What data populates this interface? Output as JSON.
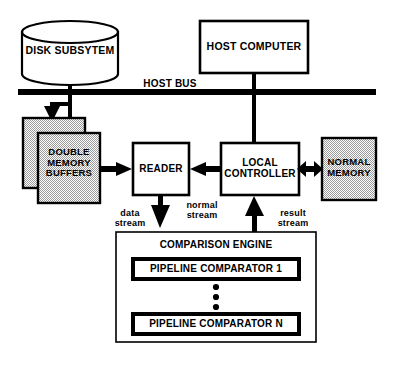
{
  "diagram": {
    "title_text": "",
    "colors": {
      "stroke": "#000000",
      "fill_white": "#ffffff",
      "fill_gray": "#d9d9d9",
      "background": "#ffffff"
    },
    "nodes": {
      "disk_subsystem": {
        "label": "DISK SUBSYTEM",
        "shape": "cylinder",
        "fill": "#ffffff"
      },
      "host_computer": {
        "label": "HOST COMPUTER",
        "shape": "rect",
        "fill": "#ffffff"
      },
      "host_bus": {
        "label": "HOST BUS",
        "shape": "bus-line"
      },
      "double_memory_buffers": {
        "label": "DOUBLE\nMEMORY\nBUFFERS",
        "shape": "stacked-rect",
        "fill": "#d9d9d9"
      },
      "reader": {
        "label": "READER",
        "shape": "rect",
        "fill": "#ffffff"
      },
      "local_controller": {
        "label": "LOCAL\nCONTROLLER",
        "shape": "rect",
        "fill": "#ffffff"
      },
      "normal_memory": {
        "label": "NORMAL\nMEMORY",
        "shape": "rect",
        "fill": "#d9d9d9"
      },
      "comparison_engine": {
        "label": "COMPARISON  ENGINE",
        "shape": "rect",
        "fill": "#ffffff",
        "comparators": [
          {
            "label": "PIPELINE COMPARATOR 1"
          },
          {
            "label": "PIPELINE COMPARATOR N"
          }
        ],
        "ellipsis": "vertical-dots"
      }
    },
    "edge_labels": {
      "data_stream": "data\nstream",
      "normal_stream": "normal\nstream",
      "result_stream": "result\nstream"
    }
  }
}
